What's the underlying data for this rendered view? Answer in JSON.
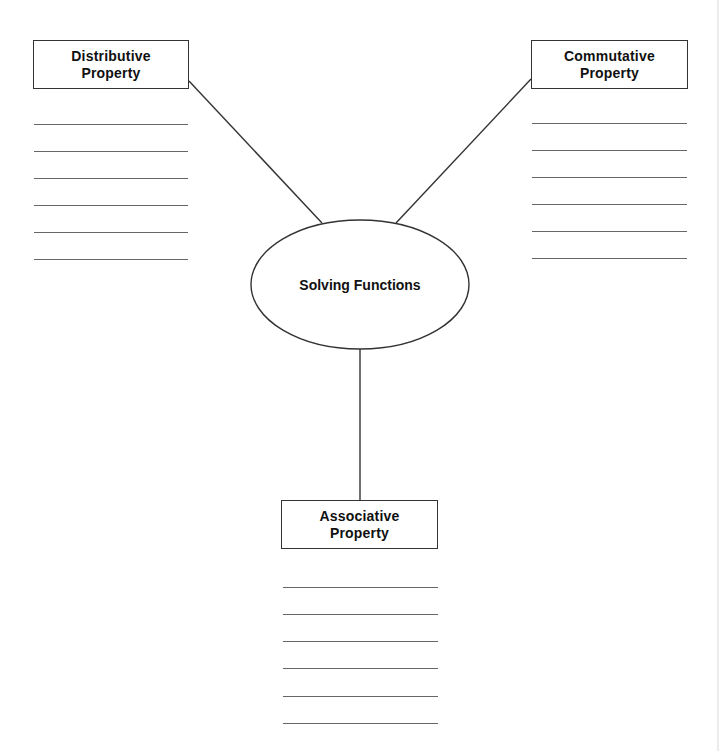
{
  "center": {
    "label": "Solving Functions",
    "shape": "ellipse"
  },
  "nodes": [
    {
      "id": "distributive",
      "line1": "Distributive",
      "line2": "Property",
      "answer_lines": 6
    },
    {
      "id": "commutative",
      "line1": "Commutative",
      "line2": "Property",
      "answer_lines": 6
    },
    {
      "id": "associative",
      "line1": "Associative",
      "line2": "Property",
      "answer_lines": 6
    }
  ],
  "colors": {
    "stroke": "#333333",
    "answer_line": "#666666",
    "background": "#ffffff"
  }
}
